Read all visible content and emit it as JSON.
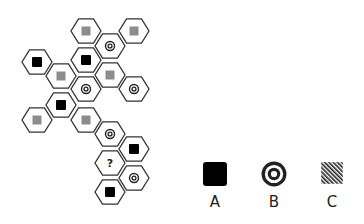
{
  "puzzle": {
    "hex_radius": 15,
    "cells": [
      {
        "x": 86,
        "y": 31,
        "symbol": "gray-square"
      },
      {
        "x": 134,
        "y": 31,
        "symbol": "gray-square"
      },
      {
        "x": 110,
        "y": 46,
        "symbol": "target"
      },
      {
        "x": 37,
        "y": 62,
        "symbol": "black-square"
      },
      {
        "x": 86,
        "y": 60,
        "symbol": "black-square"
      },
      {
        "x": 61,
        "y": 76,
        "symbol": "gray-square"
      },
      {
        "x": 110,
        "y": 75,
        "symbol": "gray-square"
      },
      {
        "x": 86,
        "y": 89,
        "symbol": "target"
      },
      {
        "x": 134,
        "y": 89,
        "symbol": "target"
      },
      {
        "x": 61,
        "y": 105,
        "symbol": "black-square"
      },
      {
        "x": 37,
        "y": 120,
        "symbol": "gray-square"
      },
      {
        "x": 86,
        "y": 120,
        "symbol": "gray-square"
      },
      {
        "x": 110,
        "y": 134,
        "symbol": "target"
      },
      {
        "x": 134,
        "y": 149,
        "symbol": "black-square"
      },
      {
        "x": 110,
        "y": 163,
        "symbol": "question",
        "text": "?"
      },
      {
        "x": 134,
        "y": 178,
        "symbol": "target"
      },
      {
        "x": 110,
        "y": 192,
        "symbol": "black-square"
      }
    ]
  },
  "options": [
    {
      "label": "A",
      "symbol": "black-square",
      "x": 215,
      "y": 174
    },
    {
      "label": "B",
      "symbol": "target",
      "x": 274,
      "y": 174
    },
    {
      "label": "C",
      "symbol": "hatched-square",
      "x": 332,
      "y": 173
    }
  ],
  "colors": {
    "hex_stroke": "#333333",
    "black": "#000000",
    "gray": "#8c8c8c"
  }
}
